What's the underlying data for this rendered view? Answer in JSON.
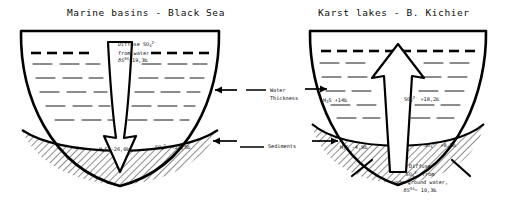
{
  "figure": {
    "panels": [
      {
        "id": "marine",
        "title": "Marine basins - Black Sea",
        "arrow_direction": "down",
        "annotations": {
          "diffuse": {
            "line1_prefix": "Diffuse SO",
            "line1_sub": "4",
            "line1_sup": "2-",
            "line2": "from water",
            "line3_delta": "δ",
            "line3_symbol": "S",
            "line3_sup": "34",
            "line3_value": "=19,3‰"
          },
          "sediment_left": {
            "symbol": "H",
            "sub": "2",
            "symbol_tail": "S",
            "value": "-26,0‰"
          },
          "sediment_right": {
            "symbol": "SO",
            "sub": "4",
            "sup": "2-",
            "value": "+22,5‰"
          }
        }
      },
      {
        "id": "karst",
        "title": "Karst lakes - B. Kichier",
        "arrow_direction": "up",
        "annotations": {
          "water_left": {
            "symbol": "H",
            "sub": "2",
            "symbol_tail": "S",
            "value": "+14‰"
          },
          "water_right": {
            "symbol": "SO",
            "sub": "4",
            "sup": "2-",
            "value": "+18,2‰"
          },
          "sediment_left": {
            "symbol": "H",
            "sub": "2",
            "symbol_tail": "S",
            "value": "-4,9‰"
          },
          "sediment_right": {
            "symbol": "SO",
            "sub": "4",
            "sup": "2-",
            "value": "+8,5‰"
          },
          "diffuse": {
            "line1": "Diffuse",
            "line2_prefix": "SO",
            "line2_sub": "4",
            "line2_sup": "2-",
            "line2_tail": " from",
            "line3": "underground water,",
            "line4_delta": "δ",
            "line4_symbol": "S",
            "line4_sup": "34",
            "line4_value": "= 10,3‰"
          }
        }
      }
    ],
    "legend": {
      "water_thickness_line1": "Water",
      "water_thickness_line2": "Thickness",
      "sediments": "Sediments"
    },
    "colors": {
      "ink": "#000000",
      "background": "#ffffff"
    }
  }
}
